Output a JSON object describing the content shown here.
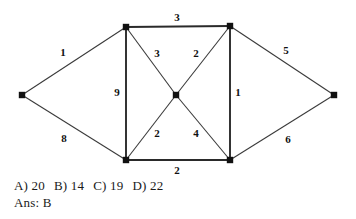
{
  "figure": {
    "kind": "weighted-undirected-graph",
    "width": 356,
    "height": 219,
    "edge_color": "#3a3a3a",
    "vertex_color": "#111111",
    "background": "#ffffff"
  },
  "chart_data": {
    "type": "diagram",
    "title": "",
    "xlabel": "",
    "ylabel": "",
    "graph_type": "weighted undirected graph",
    "nodes": [
      {
        "id": "L",
        "x": 22,
        "y": 95,
        "label": ""
      },
      {
        "id": "TL",
        "x": 126,
        "y": 27,
        "label": ""
      },
      {
        "id": "TR",
        "x": 230,
        "y": 26,
        "label": ""
      },
      {
        "id": "C",
        "x": 176,
        "y": 95,
        "label": ""
      },
      {
        "id": "BL",
        "x": 126,
        "y": 160,
        "label": ""
      },
      {
        "id": "BR",
        "x": 230,
        "y": 160,
        "label": ""
      },
      {
        "id": "R",
        "x": 334,
        "y": 95,
        "label": ""
      }
    ],
    "edges": [
      {
        "from": "L",
        "to": "TL",
        "weight": "1",
        "lx": 63,
        "ly": 52,
        "thick": false
      },
      {
        "from": "L",
        "to": "BL",
        "weight": "8",
        "lx": 64,
        "ly": 138,
        "thick": false
      },
      {
        "from": "TL",
        "to": "TR",
        "weight": "3",
        "lx": 177,
        "ly": 17,
        "thick": true
      },
      {
        "from": "TL",
        "to": "BL",
        "weight": "9",
        "lx": 117,
        "ly": 92,
        "thick": true
      },
      {
        "from": "TL",
        "to": "C",
        "weight": "3",
        "lx": 157,
        "ly": 53,
        "thick": false
      },
      {
        "from": "TR",
        "to": "C",
        "weight": "2",
        "lx": 196,
        "ly": 53,
        "thick": false
      },
      {
        "from": "TR",
        "to": "BR",
        "weight": "1",
        "lx": 238,
        "ly": 92,
        "thick": true
      },
      {
        "from": "TR",
        "to": "R",
        "weight": "5",
        "lx": 286,
        "ly": 50,
        "thick": false
      },
      {
        "from": "BL",
        "to": "C",
        "weight": "2",
        "lx": 157,
        "ly": 133,
        "thick": false
      },
      {
        "from": "BR",
        "to": "C",
        "weight": "4",
        "lx": 196,
        "ly": 133,
        "thick": false
      },
      {
        "from": "BL",
        "to": "BR",
        "weight": "2",
        "lx": 177,
        "ly": 170,
        "thick": true
      },
      {
        "from": "BR",
        "to": "R",
        "weight": "6",
        "lx": 288,
        "ly": 139,
        "thick": false
      }
    ],
    "weights": [
      1,
      8,
      3,
      9,
      3,
      2,
      1,
      5,
      2,
      4,
      2,
      6
    ]
  },
  "question": {
    "options": [
      {
        "key": "A)",
        "value": "20"
      },
      {
        "key": "B)",
        "value": "14"
      },
      {
        "key": "C)",
        "value": "19"
      },
      {
        "key": "D)",
        "value": "22"
      }
    ],
    "answer_label": "Ans:",
    "answer_value": "B"
  }
}
